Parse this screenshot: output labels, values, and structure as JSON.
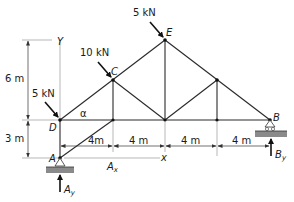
{
  "figure": {
    "type": "plane truss free-body diagram",
    "nodes": {
      "A": {
        "label": "A",
        "x": 60,
        "y": 158
      },
      "D": {
        "label": "D",
        "x": 60,
        "y": 120
      },
      "C": {
        "label": "C",
        "x": 113,
        "y": 80
      },
      "E": {
        "label": "E",
        "x": 165,
        "y": 40
      },
      "F": {
        "label": "",
        "x": 217,
        "y": 80
      },
      "B": {
        "label": "B",
        "x": 270,
        "y": 120
      },
      "G": {
        "label": "",
        "x": 113,
        "y": 120
      },
      "H": {
        "label": "",
        "x": 165,
        "y": 120
      },
      "I": {
        "label": "",
        "x": 217,
        "y": 120
      }
    },
    "loads": [
      {
        "label": "5 kN",
        "at": "E"
      },
      {
        "label": "10 kN",
        "at": "C"
      },
      {
        "label": "5 kN",
        "at": "D"
      }
    ],
    "reactions": {
      "Ax": "A",
      "Ay": "A",
      "By": "B"
    },
    "angle_label": "α",
    "axes": {
      "y": "Y",
      "x": "x"
    },
    "dimensions": {
      "vertical": [
        "6 m",
        "3 m"
      ],
      "horizontal": [
        "4m",
        "4 m",
        "4 m",
        "4 m"
      ]
    }
  }
}
